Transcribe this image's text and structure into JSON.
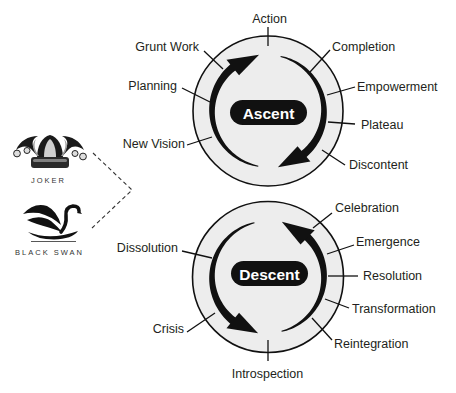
{
  "colors": {
    "background": "#ffffff",
    "disc_fill": "#ededed",
    "stroke": "#111111",
    "pill_fill": "#111111",
    "text": "#231f20"
  },
  "diagram": {
    "ascent": {
      "title": "Ascent",
      "direction": "clockwise",
      "stages": [
        "New Vision",
        "Planning",
        "Grunt Work",
        "Action",
        "Completion",
        "Empowerment",
        "Plateau",
        "Discontent"
      ]
    },
    "descent": {
      "title": "Descent",
      "direction": "counterclockwise",
      "stages": [
        "Dissolution",
        "Crisis",
        "Introspection",
        "Reintegration",
        "Transformation",
        "Resolution",
        "Emergence",
        "Celebration"
      ]
    }
  },
  "archetypes": [
    {
      "label": "JOKER",
      "icon": "jester-hat-icon"
    },
    {
      "label": "BLACK SWAN",
      "icon": "black-swan-icon"
    }
  ]
}
